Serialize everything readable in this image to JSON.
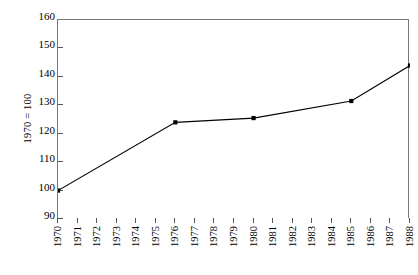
{
  "chart_data": {
    "type": "line",
    "title": "",
    "xlabel": "",
    "ylabel": "1970 = 100",
    "ylim": [
      90,
      160
    ],
    "yticks": [
      90,
      100,
      110,
      120,
      130,
      140,
      150,
      160
    ],
    "xlim": [
      1970,
      1988
    ],
    "xticks": [
      1970,
      1971,
      1972,
      1973,
      1974,
      1975,
      1976,
      1977,
      1978,
      1979,
      1980,
      1981,
      1982,
      1983,
      1984,
      1985,
      1986,
      1987,
      1988
    ],
    "grid": false,
    "legend": null,
    "series": [
      {
        "name": "index",
        "marker": "square",
        "color": "#000000",
        "x": [
          1970,
          1976,
          1980,
          1985,
          1988
        ],
        "values": [
          100,
          124,
          125.5,
          131.5,
          144
        ]
      }
    ]
  },
  "axes": {
    "y_title": "1970 = 100",
    "y_tick_labels": [
      "160",
      "150",
      "140",
      "130",
      "120",
      "110",
      "100",
      "90"
    ],
    "x_tick_labels": [
      "1970",
      "1971",
      "1972",
      "1973",
      "1974",
      "1975",
      "1976",
      "1977",
      "1978",
      "1979",
      "1980",
      "1981",
      "1982",
      "1983",
      "1984",
      "1985",
      "1986",
      "1987",
      "1988"
    ]
  },
  "colors": {
    "line": "#000000",
    "marker": "#000000",
    "frame": "#777777",
    "tick": "#555555",
    "background": "#ffffff"
  }
}
